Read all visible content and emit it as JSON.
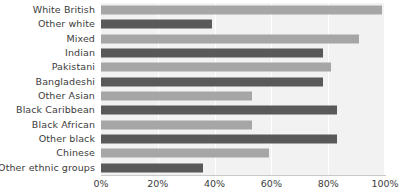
{
  "chart_data": {
    "type": "bar",
    "orientation": "horizontal",
    "title": "",
    "xlabel": "",
    "ylabel": "",
    "xlim": [
      0,
      100
    ],
    "xticks": [
      "0%",
      "20%",
      "40%",
      "60%",
      "80%",
      "100%"
    ],
    "xtick_values": [
      0,
      20,
      40,
      60,
      80,
      100
    ],
    "grid": "vertical",
    "legend": "none",
    "categories": [
      "White British",
      "Other white",
      "Mixed",
      "Indian",
      "Pakistani",
      "Bangladeshi",
      "Other Asian",
      "Black Caribbean",
      "Black African",
      "Other black",
      "Chinese",
      "Other ethnic groups"
    ],
    "values": [
      99,
      39,
      91,
      78,
      81,
      78,
      53,
      83,
      53,
      83,
      59,
      36
    ],
    "bar_colors": [
      "#a6a6a6",
      "#595959",
      "#a6a6a6",
      "#595959",
      "#a6a6a6",
      "#595959",
      "#a6a6a6",
      "#595959",
      "#a6a6a6",
      "#595959",
      "#a6a6a6",
      "#595959"
    ]
  },
  "colors": {
    "plot_background": "#f2f2f2",
    "gridline": "#ffffff",
    "axis_line": "#c9c9c9",
    "text": "#3c3c3c",
    "bar_light": "#a6a6a6",
    "bar_dark": "#595959"
  }
}
